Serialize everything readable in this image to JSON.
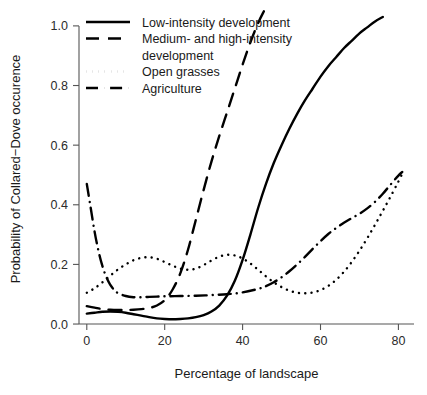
{
  "chart_data": {
    "type": "line",
    "title": "",
    "xlabel": "Percentage of landscape",
    "ylabel": "Probability of Collared−Dove occurence",
    "xlim": [
      -2,
      84
    ],
    "ylim": [
      -0.02,
      1.06
    ],
    "xticks": [
      0,
      20,
      40,
      60,
      80
    ],
    "xtick_labels": [
      "0",
      "20",
      "40",
      "60",
      "80"
    ],
    "yticks": [
      0.0,
      0.2,
      0.4,
      0.6,
      0.8,
      1.0
    ],
    "ytick_labels": [
      "0.0",
      "0.2",
      "0.4",
      "0.6",
      "0.8",
      "1.0"
    ],
    "grid": false,
    "legend_position": "top-left",
    "line_color": "#000000",
    "axis_color": "#555555",
    "series": [
      {
        "name": "Low-intensity development",
        "style": "solid",
        "x": [
          0,
          2,
          4,
          6,
          8,
          10,
          12,
          14,
          16,
          18,
          20,
          22,
          24,
          26,
          28,
          30,
          32,
          34,
          36,
          38,
          40,
          42,
          44,
          46,
          48,
          50,
          52,
          54,
          56,
          58,
          60,
          62,
          64,
          66,
          68,
          70,
          72,
          74,
          76
        ],
        "y": [
          0.035,
          0.038,
          0.041,
          0.042,
          0.041,
          0.038,
          0.033,
          0.028,
          0.023,
          0.019,
          0.017,
          0.016,
          0.017,
          0.019,
          0.023,
          0.03,
          0.042,
          0.062,
          0.095,
          0.145,
          0.215,
          0.3,
          0.39,
          0.47,
          0.54,
          0.6,
          0.655,
          0.705,
          0.75,
          0.79,
          0.83,
          0.865,
          0.895,
          0.925,
          0.95,
          0.975,
          0.995,
          1.015,
          1.03
        ]
      },
      {
        "name": "Medium- and high-intensity development",
        "style": "dashed",
        "x": [
          0,
          2,
          4,
          6,
          8,
          10,
          12,
          14,
          16,
          18,
          20,
          22,
          24,
          26,
          28,
          30,
          32,
          34,
          36,
          38,
          40,
          42,
          44,
          45.5
        ],
        "y": [
          0.06,
          0.055,
          0.05,
          0.048,
          0.047,
          0.047,
          0.048,
          0.05,
          0.054,
          0.062,
          0.08,
          0.115,
          0.17,
          0.25,
          0.35,
          0.45,
          0.545,
          0.63,
          0.71,
          0.79,
          0.87,
          0.945,
          1.01,
          1.05
        ]
      },
      {
        "name": "Open grasses",
        "style": "dotted",
        "x": [
          0,
          2,
          4,
          6,
          8,
          10,
          12,
          14,
          16,
          18,
          20,
          22,
          24,
          26,
          28,
          30,
          32,
          34,
          36,
          38,
          40,
          42,
          44,
          46,
          48,
          50,
          52,
          54,
          56,
          58,
          60,
          62,
          64,
          66,
          68,
          70,
          72,
          74,
          76,
          78,
          80,
          81
        ],
        "y": [
          0.105,
          0.12,
          0.14,
          0.162,
          0.183,
          0.2,
          0.214,
          0.222,
          0.224,
          0.219,
          0.208,
          0.196,
          0.186,
          0.182,
          0.186,
          0.198,
          0.213,
          0.226,
          0.232,
          0.23,
          0.22,
          0.203,
          0.182,
          0.16,
          0.14,
          0.124,
          0.112,
          0.105,
          0.103,
          0.106,
          0.114,
          0.128,
          0.148,
          0.175,
          0.208,
          0.246,
          0.288,
          0.333,
          0.38,
          0.428,
          0.478,
          0.505
        ]
      },
      {
        "name": "Agriculture",
        "style": "dashdot",
        "x": [
          0,
          1,
          2,
          3,
          4,
          5,
          6,
          7,
          8,
          10,
          12,
          14,
          16,
          18,
          20,
          24,
          28,
          32,
          36,
          40,
          44,
          46,
          48,
          50,
          52,
          54,
          56,
          58,
          60,
          62,
          64,
          66,
          68,
          70,
          72,
          74,
          76,
          78,
          80,
          81
        ],
        "y": [
          0.47,
          0.39,
          0.31,
          0.245,
          0.195,
          0.158,
          0.132,
          0.115,
          0.104,
          0.094,
          0.09,
          0.09,
          0.091,
          0.092,
          0.093,
          0.094,
          0.095,
          0.097,
          0.1,
          0.106,
          0.118,
          0.127,
          0.14,
          0.157,
          0.177,
          0.2,
          0.225,
          0.252,
          0.278,
          0.302,
          0.322,
          0.34,
          0.355,
          0.37,
          0.388,
          0.41,
          0.437,
          0.468,
          0.498,
          0.51
        ]
      }
    ]
  },
  "legend": {
    "entries": [
      {
        "label": "Low-intensity development",
        "style": "solid"
      },
      {
        "label": "Medium- and high-intensity",
        "label2": "development",
        "style": "dashed"
      },
      {
        "label": "Open grasses",
        "style": "dotted"
      },
      {
        "label": "Agriculture",
        "style": "dashdot"
      }
    ]
  }
}
